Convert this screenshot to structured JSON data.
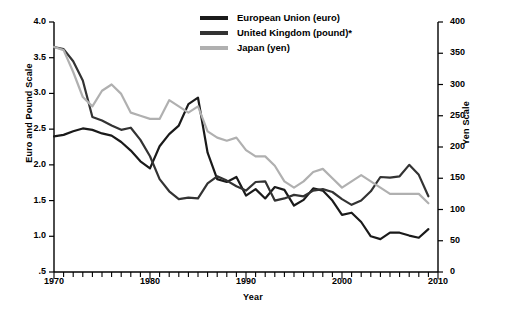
{
  "chart_data": {
    "type": "line",
    "title": "",
    "xlabel": "Year",
    "ylabel_left": "Euro and Pound Scale",
    "ylabel_right": "Yen Scale",
    "xlim": [
      1970,
      2010
    ],
    "xticks": [
      1970,
      1980,
      1990,
      2000,
      2010
    ],
    "xtick_labels": [
      "1970",
      "1980",
      "1990",
      "2000",
      "2010"
    ],
    "minor_xtick_interval": 1,
    "ylim_left": [
      0.5,
      4.0
    ],
    "yticks_left": [
      0.5,
      1.0,
      1.5,
      2.0,
      2.5,
      3.0,
      3.5,
      4.0
    ],
    "ytick_labels_left": [
      ".5",
      "1.0",
      "1.5",
      "2.0",
      "2.5",
      "3.0",
      "3.5",
      "4.0"
    ],
    "ylim_right": [
      0,
      400
    ],
    "yticks_right": [
      0,
      50,
      100,
      150,
      200,
      250,
      300,
      350,
      400
    ],
    "ytick_labels_right": [
      "0",
      "50",
      "100",
      "150",
      "200",
      "250",
      "300",
      "350",
      "400"
    ],
    "grid": false,
    "legend_position": "top-center",
    "x": [
      1970,
      1971,
      1972,
      1973,
      1974,
      1975,
      1976,
      1977,
      1978,
      1979,
      1980,
      1981,
      1982,
      1983,
      1984,
      1985,
      1986,
      1987,
      1988,
      1989,
      1990,
      1991,
      1992,
      1993,
      1994,
      1995,
      1996,
      1997,
      1998,
      1999,
      2000,
      2001,
      2002,
      2003,
      2004,
      2005,
      2006,
      2007,
      2008,
      2009
    ],
    "series": [
      {
        "name": "European Union (euro)",
        "axis": "left",
        "color": "#1a1a1a",
        "values": [
          2.4,
          2.42,
          2.47,
          2.51,
          2.49,
          2.44,
          2.41,
          2.32,
          2.2,
          2.05,
          1.95,
          2.26,
          2.43,
          2.55,
          2.85,
          2.94,
          2.17,
          1.8,
          1.76,
          1.83,
          1.57,
          1.66,
          1.53,
          1.69,
          1.65,
          1.43,
          1.51,
          1.67,
          1.64,
          1.5,
          1.3,
          1.33,
          1.2,
          1.0,
          0.96,
          1.05,
          1.05,
          1.01,
          0.98,
          1.1
        ]
      },
      {
        "name": "United Kingdom (pound)*",
        "axis": "left",
        "color": "#333333",
        "values": [
          3.65,
          3.62,
          3.45,
          3.18,
          2.67,
          2.62,
          2.55,
          2.49,
          2.52,
          2.35,
          2.12,
          1.8,
          1.63,
          1.52,
          1.54,
          1.53,
          1.74,
          1.84,
          1.78,
          1.7,
          1.64,
          1.76,
          1.77,
          1.5,
          1.53,
          1.58,
          1.56,
          1.64,
          1.66,
          1.62,
          1.52,
          1.44,
          1.5,
          1.63,
          1.83,
          1.82,
          1.84,
          2.0,
          1.86,
          1.56
        ]
      },
      {
        "name": "Japan (yen)",
        "axis": "right",
        "color": "#b0b0b0",
        "values": [
          360,
          355,
          320,
          280,
          265,
          290,
          300,
          285,
          255,
          250,
          245,
          245,
          275,
          265,
          255,
          265,
          225,
          215,
          210,
          215,
          195,
          185,
          185,
          170,
          145,
          135,
          145,
          160,
          165,
          150,
          135,
          145,
          155,
          145,
          135,
          125,
          125,
          125,
          125,
          110
        ]
      }
    ]
  }
}
